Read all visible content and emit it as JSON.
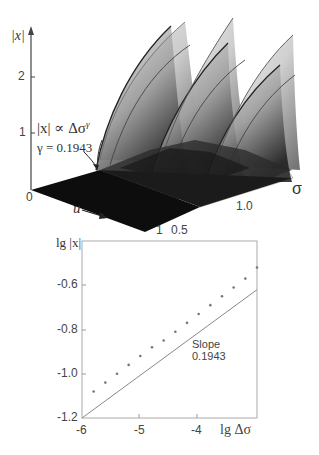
{
  "chart_data": [
    {
      "type": "surface",
      "title": "",
      "zlabel": "|x|",
      "xlabel": "u",
      "ylabel": "σ",
      "z_ticks": [
        "0",
        "1",
        "2"
      ],
      "x_ticks": [
        "0",
        "1"
      ],
      "y_ticks": [
        "0.5",
        "1.0"
      ],
      "annotation": {
        "formula": "|x| ∝ Δσ^γ",
        "gamma_text": "γ = 0.1943"
      },
      "description": "3D grayscale surface of |x| over (u, σ) showing three sawtooth-like ridge sheets rising to |x|≈2.5"
    },
    {
      "type": "scatter",
      "title": "",
      "xlabel": "lg Δσ",
      "ylabel": "lg |x|",
      "xlim": [
        -6,
        -3
      ],
      "ylim": [
        -1.2,
        -0.4
      ],
      "x_ticks": [
        -6,
        -5,
        -4
      ],
      "y_ticks": [
        -0.6,
        -0.8,
        -1.0,
        -1.2
      ],
      "grid": false,
      "series": [
        {
          "name": "data",
          "marker": "dot",
          "x": [
            -5.8,
            -5.6,
            -5.4,
            -5.2,
            -5.0,
            -4.8,
            -4.6,
            -4.4,
            -4.2,
            -4.0,
            -3.8,
            -3.6,
            -3.4,
            -3.2,
            -3.0
          ],
          "y": [
            -1.08,
            -1.04,
            -1.0,
            -0.96,
            -0.92,
            -0.88,
            -0.85,
            -0.81,
            -0.77,
            -0.73,
            -0.69,
            -0.65,
            -0.61,
            -0.57,
            -0.52
          ]
        },
        {
          "name": "fit",
          "line": "solid",
          "x": [
            -6.0,
            -3.0
          ],
          "y": [
            -1.2,
            -0.62
          ]
        }
      ],
      "annotation": {
        "line1": "Slope",
        "line2": "0.1943"
      }
    }
  ],
  "top": {
    "zlabel": "|x|",
    "z2": "2",
    "z1": "1",
    "z0": "0",
    "formula_a": "|x| ∝ Δσ",
    "formula_exp": "γ",
    "gamma": "γ = 0.1943",
    "u_label": "u",
    "u_end": "1",
    "sigma_label": "σ",
    "sigma_05": "0.5",
    "sigma_10": "1.0"
  },
  "bottom": {
    "ylabel": "lg |x|",
    "yt1": "-0.6",
    "yt2": "-0.8",
    "yt3": "-1.0",
    "yt4": "-1.2",
    "xt1": "-6",
    "xt2": "-5",
    "xt3": "-4",
    "xlabel": "lg Δσ",
    "slope_label": "Slope",
    "slope_value": "0.1943"
  }
}
